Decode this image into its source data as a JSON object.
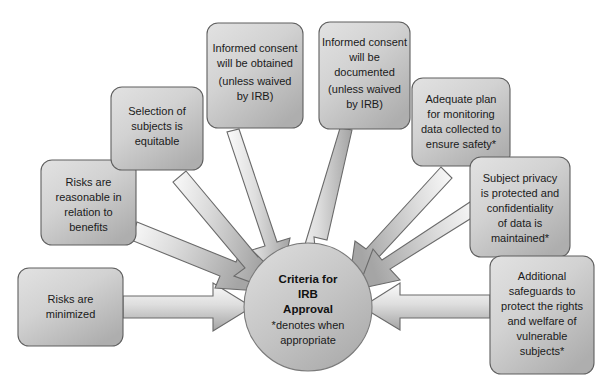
{
  "diagram": {
    "title": "Criteria for IRB Approval",
    "background_color": "#ffffff",
    "center": {
      "name": "criteria-for-irb-approval",
      "lines_bold": [
        "Criteria for",
        "IRB",
        "Approval"
      ],
      "lines_note": [
        "*denotes when",
        "appropriate"
      ],
      "fill_light": "#d6d6d6",
      "fill_dark": "#b2b2b2",
      "stroke": "#7a7a7a",
      "cx": 308,
      "cy": 307,
      "r": 64
    },
    "nodes": [
      {
        "id": "risks-minimized",
        "lines": [
          "Risks are",
          "minimized"
        ],
        "x": 18,
        "y": 268,
        "w": 105,
        "h": 78
      },
      {
        "id": "risks-reasonable",
        "lines": [
          "Risks are",
          "reasonable in",
          "relation to",
          "benefits"
        ],
        "x": 41,
        "y": 160,
        "w": 95,
        "h": 85
      },
      {
        "id": "selection-equitable",
        "lines": [
          "Selection of",
          "subjects is",
          "equitable"
        ],
        "x": 111,
        "y": 87,
        "w": 92,
        "h": 83
      },
      {
        "id": "consent-obtained",
        "lines": [
          "Informed consent",
          "will be obtained",
          "(unless waived",
          "by IRB)"
        ],
        "x": 207,
        "y": 23,
        "w": 96,
        "h": 105
      },
      {
        "id": "consent-documented",
        "lines": [
          "Informed consent",
          "will be",
          "documented",
          "(unless waived",
          "by IRB)"
        ],
        "x": 319,
        "y": 22,
        "w": 91,
        "h": 107
      },
      {
        "id": "adequate-plan-monitoring",
        "lines": [
          "Adequate plan",
          "for monitoring",
          "data collected to",
          "ensure safety*"
        ],
        "x": 412,
        "y": 78,
        "w": 98,
        "h": 88
      },
      {
        "id": "subject-privacy",
        "lines": [
          "Subject privacy",
          "is protected and",
          "confidentiality",
          "of data is",
          "maintained*"
        ],
        "x": 470,
        "y": 157,
        "w": 100,
        "h": 100
      },
      {
        "id": "additional-safeguards",
        "lines": [
          "Additional",
          "safeguards to",
          "protect the rights",
          "and welfare of",
          "vulnerable",
          "subjects*"
        ],
        "x": 490,
        "y": 256,
        "w": 104,
        "h": 118
      }
    ],
    "arrows": [
      {
        "id": "arrow-risks-minimized",
        "from": "risks-minimized"
      },
      {
        "id": "arrow-risks-reasonable",
        "from": "risks-reasonable"
      },
      {
        "id": "arrow-selection-equitable",
        "from": "selection-equitable"
      },
      {
        "id": "arrow-consent-obtained",
        "from": "consent-obtained"
      },
      {
        "id": "arrow-consent-documented",
        "from": "consent-documented"
      },
      {
        "id": "arrow-adequate-plan",
        "from": "adequate-plan-monitoring"
      },
      {
        "id": "arrow-subject-privacy",
        "from": "subject-privacy"
      },
      {
        "id": "arrow-additional-safeguards",
        "from": "additional-safeguards"
      }
    ],
    "style": {
      "box_fill_light": "#dcdcdc",
      "box_fill_dark": "#b4b4b4",
      "box_stroke": "#5f5f5f",
      "arrow_fill_light": "#f2f2f2",
      "arrow_fill_dark": "#a8a8a8",
      "arrow_stroke": "#6a6a6a",
      "text_color": "#1a1a1a"
    }
  }
}
